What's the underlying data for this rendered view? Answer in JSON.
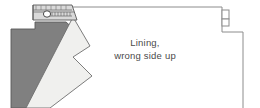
{
  "diagram": {
    "type": "sewing-instruction-illustration",
    "label": {
      "line1": "Lining,",
      "line2": "wrong side up",
      "x": 145,
      "y": 46,
      "color": "#4a4a4a"
    },
    "colors": {
      "fabric_dark": "#808080",
      "fabric_light": "#f0f0ee",
      "outline": "#5a5a5a",
      "outline_light": "#8c8c8c",
      "zipper_tape": "#d9d9d9",
      "zipper_teeth": "#8a8a8a",
      "background": "#ffffff"
    },
    "parts": [
      {
        "name": "lining-panel",
        "description": "Large background lining panel, wrong side up",
        "fill": "#ffffff",
        "stroke": "#8c8c8c"
      },
      {
        "name": "dark-fabric-piece",
        "description": "Dark grey fabric piece at lower left with stepped top edge",
        "fill": "#808080",
        "stroke": "#5a5a5a"
      },
      {
        "name": "light-fabric-piece",
        "description": "Light zig-zag folded fabric piece overlapping the dark piece",
        "fill": "#f0f0ee",
        "stroke": "#6e6e6e"
      },
      {
        "name": "zipper",
        "description": "Zipper tape with teeth and a pull slider at top left",
        "fill": "#d9d9d9",
        "stroke": "#5a5a5a"
      },
      {
        "name": "right-edge-notch",
        "description": "Small rectangular notch on the right edge of the panel",
        "fill": "#ffffff",
        "stroke": "#8c8c8c"
      }
    ]
  }
}
